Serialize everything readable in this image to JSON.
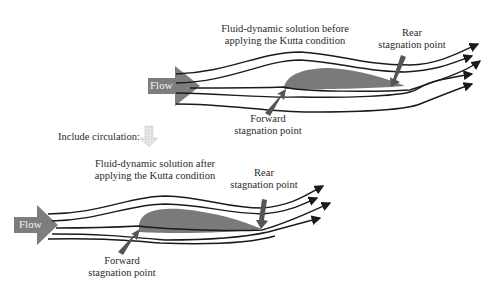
{
  "top_panel": {
    "title_line1": "Fluid-dynamic solution before",
    "title_line2": "applying the Kutta condition",
    "flow_label": "Flow",
    "rear_label_line1": "Rear",
    "rear_label_line2": "stagnation point",
    "forward_label_line1": "Forward",
    "forward_label_line2": "stagnation point"
  },
  "transition": {
    "label": "Include circulation:",
    "arrow_icon": "down-arrow-icon"
  },
  "bottom_panel": {
    "title_line1": "Fluid-dynamic solution after",
    "title_line2": "applying the Kutta condition",
    "flow_label": "Flow",
    "rear_label_line1": "Rear",
    "rear_label_line2": "stagnation point",
    "forward_label_line1": "Forward",
    "forward_label_line2": "stagnation point"
  },
  "colors": {
    "airfoil": "#7a7a7a",
    "flow_arrow": "#7d7d7d",
    "pointer": "#555555",
    "streamline": "#1a1a1a",
    "circulation_arrow": "#d9d9d9"
  }
}
